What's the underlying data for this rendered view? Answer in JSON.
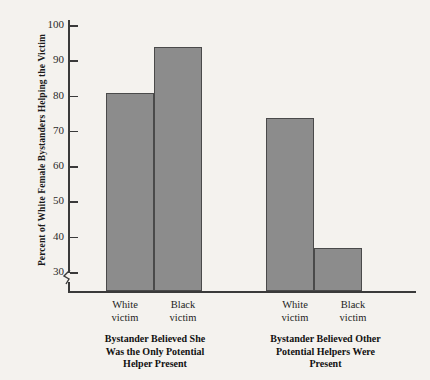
{
  "chart_data": {
    "type": "bar",
    "title": "",
    "xlabel": "",
    "ylabel": "Percent of White Female Bystanders Helping the Victim",
    "ylim": [
      30,
      100
    ],
    "yticks": [
      30,
      40,
      50,
      60,
      70,
      80,
      90,
      100
    ],
    "ytick_labels": [
      "30",
      "40",
      "50",
      "60",
      "70",
      "80",
      "90",
      "100"
    ],
    "axis_break": true,
    "axis_break_note": "y-axis broken below 30",
    "grid": false,
    "legend": "none",
    "bar_color": "#8c8c8c",
    "bar_edge_color": "#4a4a4a",
    "background_color": "#f4f2ee",
    "categories": [
      "White victim",
      "Black victim",
      "White victim",
      "Black victim"
    ],
    "values": [
      81,
      94,
      74,
      37
    ],
    "groups": [
      {
        "caption": "Bystander Believed She Was the Only Potential Helper Present",
        "caption_lines": [
          "Bystander Believed She",
          "Was the Only Potential",
          "Helper Present"
        ],
        "bars": [
          {
            "label_lines": [
              "White",
              "victim"
            ],
            "label": "White victim",
            "value": 81
          },
          {
            "label_lines": [
              "Black",
              "victim"
            ],
            "label": "Black victim",
            "value": 94
          }
        ]
      },
      {
        "caption": "Bystander Believed Other Potential Helpers Were Present",
        "caption_lines": [
          "Bystander Believed Other",
          "Potential Helpers Were",
          "Present"
        ],
        "bars": [
          {
            "label_lines": [
              "White",
              "victim"
            ],
            "label": "White victim",
            "value": 74
          },
          {
            "label_lines": [
              "Black",
              "victim"
            ],
            "label": "Black victim",
            "value": 37
          }
        ]
      }
    ]
  },
  "axis": {
    "y_title": "Percent of White Female Bystanders Helping the Victim"
  },
  "ticks": [
    {
      "label": "100"
    },
    {
      "label": "90"
    },
    {
      "label": "80"
    },
    {
      "label": "70"
    },
    {
      "label": "60"
    },
    {
      "label": "50"
    },
    {
      "label": "40"
    },
    {
      "label": "30"
    }
  ],
  "group1": {
    "bar1_line1": "White",
    "bar1_line2": "victim",
    "bar2_line1": "Black",
    "bar2_line2": "victim",
    "caption_line1": "Bystander Believed She",
    "caption_line2": "Was the Only Potential",
    "caption_line3": "Helper Present"
  },
  "group2": {
    "bar1_line1": "White",
    "bar1_line2": "victim",
    "bar2_line1": "Black",
    "bar2_line2": "victim",
    "caption_line1": "Bystander Believed Other",
    "caption_line2": "Potential Helpers Were",
    "caption_line3": "Present"
  }
}
